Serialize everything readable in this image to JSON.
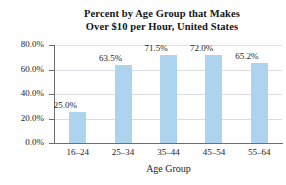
{
  "chart_data": {
    "type": "bar",
    "title": "Percent by Age Group that Makes Over $10 per Hour, United States",
    "title_line1": "Percent by Age Group that Makes",
    "title_line2": "Over $10 per Hour, United States",
    "xlabel": "Age Group",
    "ylabel": "",
    "ylim": [
      0,
      80
    ],
    "grid": true,
    "legend": "none",
    "bar_color": "#aed3ef",
    "categories": [
      "16–24",
      "25–34",
      "35–44",
      "45–54",
      "55–64"
    ],
    "values": [
      25.0,
      63.5,
      71.5,
      72.0,
      65.2
    ],
    "data_labels": [
      "25.0%",
      "63.5%",
      "71.5%",
      "72.0%",
      "65.2%"
    ],
    "yticks": [
      80,
      60,
      40,
      20,
      0
    ],
    "ytick_labels": [
      "80.0%",
      "60.0%",
      "40.0%",
      "20.0%",
      "0.0%"
    ]
  },
  "axis": {
    "y": {
      "ticks": [
        {
          "label": "80.0%",
          "value": 80
        },
        {
          "label": "60.0%",
          "value": 60
        },
        {
          "label": "40.0%",
          "value": 40
        },
        {
          "label": "20.0%",
          "value": 20
        },
        {
          "label": "0.0%",
          "value": 0
        }
      ]
    },
    "x": {
      "title": "Age Group",
      "categories": [
        {
          "label": "16–24"
        },
        {
          "label": "25–34"
        },
        {
          "label": "35–44"
        },
        {
          "label": "45–54"
        },
        {
          "label": "55–64"
        }
      ]
    }
  },
  "bars": [
    {
      "label": "25.0%",
      "category": "16–24",
      "value": 25.0
    },
    {
      "label": "63.5%",
      "category": "25–34",
      "value": 63.5
    },
    {
      "label": "71.5%",
      "category": "35–44",
      "value": 71.5
    },
    {
      "label": "72.0%",
      "category": "45–54",
      "value": 72.0
    },
    {
      "label": "65.2%",
      "category": "55–64",
      "value": 65.2
    }
  ]
}
